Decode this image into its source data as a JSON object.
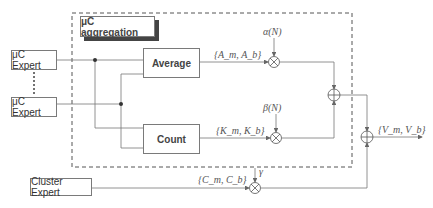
{
  "diagram": {
    "aggregation_title": "μC aggregation",
    "experts": [
      {
        "label": "μC Expert"
      },
      {
        "label": "μC Expert"
      }
    ],
    "cluster_expert": "Cluster Expert",
    "average_label": "Average",
    "count_label": "Count",
    "signals": {
      "average_out": "{A_m, A_b}",
      "count_out": "{K_m, K_b}",
      "cluster_out": "{C_m, C_b}",
      "final_out": "{V_m, V_b}"
    },
    "weights": {
      "alpha": "α(N)",
      "beta": "β(N)",
      "gamma": "γ"
    },
    "operators": {
      "multiply": "⊗",
      "sum": "⊕"
    }
  }
}
